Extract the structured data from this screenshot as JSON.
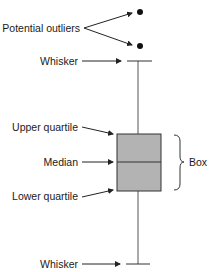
{
  "diagram": {
    "labels": {
      "potential_outliers": "Potential outliers",
      "whisker_top": "Whisker",
      "upper_quartile": "Upper quartile",
      "median": "Median",
      "lower_quartile": "Lower quartile",
      "whisker_bottom": "Whisker",
      "box": "Box"
    },
    "colors": {
      "box_fill": "#b3b3b3",
      "stroke": "#333333",
      "text": "#1a1a1a"
    }
  }
}
